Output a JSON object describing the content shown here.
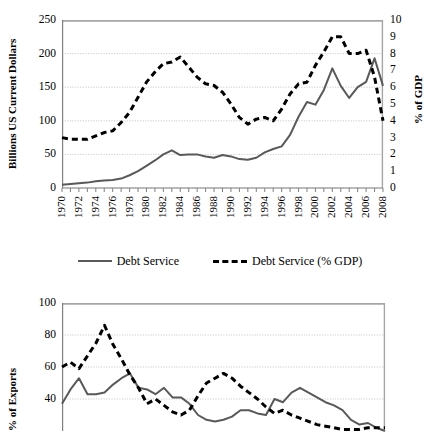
{
  "figure": {
    "background": "#ffffff",
    "series_colors": {
      "solid": "#595959",
      "dashed": "#000000",
      "gridline": "#bfbfbf",
      "border": "#a6a6a6"
    }
  },
  "chart_data": [
    {
      "id": "debt-service-chart",
      "type": "line",
      "title": "",
      "xlabel": "",
      "ylabel": "Billions US Current Dollars",
      "y2label": "% of GDP",
      "xlim": [
        1970,
        2008
      ],
      "ylim": [
        0,
        250
      ],
      "y2lim": [
        0,
        10
      ],
      "yticks": [
        0,
        50,
        100,
        150,
        200,
        250
      ],
      "y2ticks": [
        0,
        1,
        2,
        3,
        4,
        5,
        6,
        7,
        8,
        9,
        10
      ],
      "ytick_labels": [
        "0",
        "50",
        "100",
        "150",
        "200",
        "250"
      ],
      "y2tick_labels": [
        "0",
        "1",
        "2",
        "3",
        "4",
        "5",
        "6",
        "7",
        "8",
        "9",
        "10"
      ],
      "grid": true,
      "legend_position": "bottom",
      "x": [
        1970,
        1971,
        1972,
        1973,
        1974,
        1975,
        1976,
        1977,
        1978,
        1979,
        1980,
        1981,
        1982,
        1983,
        1984,
        1985,
        1986,
        1987,
        1988,
        1989,
        1990,
        1991,
        1992,
        1993,
        1994,
        1995,
        1996,
        1997,
        1998,
        1999,
        2000,
        2001,
        2002,
        2003,
        2004,
        2005,
        2006,
        2007,
        2008
      ],
      "xtick_labels": [
        "1970",
        "1972",
        "1974",
        "1976",
        "1978",
        "1980",
        "1982",
        "1984",
        "1986",
        "1988",
        "1990",
        "1992",
        "1994",
        "1996",
        "1998",
        "2000",
        "2002",
        "2004",
        "2006",
        "2008"
      ],
      "series": [
        {
          "name": "Debt Service",
          "style": "solid",
          "axis": "left",
          "color": "#595959",
          "values": [
            5,
            6,
            7,
            8,
            10,
            11,
            12,
            14,
            19,
            25,
            33,
            41,
            50,
            56,
            49,
            50,
            50,
            47,
            45,
            49,
            47,
            43,
            42,
            45,
            53,
            58,
            62,
            79,
            106,
            128,
            124,
            146,
            178,
            152,
            134,
            150,
            158,
            193,
            152
          ]
        },
        {
          "name": "Debt Service (% GDP)",
          "style": "dashed",
          "axis": "right",
          "color": "#000000",
          "values": [
            3.0,
            2.9,
            2.9,
            2.9,
            3.1,
            3.3,
            3.4,
            3.9,
            4.5,
            5.4,
            6.3,
            6.9,
            7.4,
            7.5,
            7.8,
            7.2,
            6.6,
            6.2,
            6.1,
            5.7,
            5.0,
            4.2,
            3.8,
            4.1,
            4.2,
            4.0,
            4.7,
            5.6,
            6.2,
            6.3,
            7.3,
            8.1,
            9.0,
            9.0,
            8.0,
            8.0,
            8.2,
            6.6,
            4.0
          ]
        }
      ]
    },
    {
      "id": "exports-chart",
      "type": "line",
      "title": "",
      "xlabel": "",
      "ylabel": "% of Exports",
      "xlim": [
        1970,
        2008
      ],
      "ylim": [
        20,
        100
      ],
      "yticks": [
        40,
        60,
        80,
        100
      ],
      "ytick_labels": [
        "40",
        "60",
        "80",
        "100"
      ],
      "grid": true,
      "legend_position": "none",
      "note": "lower chart is cropped by the bottom edge of the screenshot",
      "x": [
        1970,
        1971,
        1972,
        1973,
        1974,
        1975,
        1976,
        1977,
        1978,
        1979,
        1980,
        1981,
        1982,
        1983,
        1984,
        1985,
        1986,
        1987,
        1988,
        1989,
        1990,
        1991,
        1992,
        1993,
        1994,
        1995,
        1996,
        1997,
        1998,
        1999,
        2000,
        2001,
        2002,
        2003,
        2004,
        2005,
        2006,
        2007,
        2008
      ],
      "series": [
        {
          "name": "Debt Service",
          "style": "solid",
          "axis": "left",
          "color": "#595959",
          "values": [
            37,
            46,
            53,
            43,
            43,
            44,
            49,
            53,
            56,
            47,
            46,
            43,
            47,
            41,
            41,
            37,
            30,
            27,
            26,
            27,
            29,
            33,
            33,
            31,
            30,
            40,
            38,
            44,
            47,
            44,
            41,
            38,
            36,
            33,
            27,
            24,
            25,
            22,
            20
          ]
        },
        {
          "name": "Debt Service (% GDP)",
          "style": "dashed",
          "axis": "left",
          "color": "#000000",
          "values": [
            60,
            63,
            59,
            67,
            75,
            86,
            74,
            65,
            55,
            47,
            37,
            40,
            36,
            32,
            30,
            33,
            42,
            50,
            53,
            56,
            53,
            48,
            44,
            40,
            35,
            31,
            33,
            30,
            28,
            26,
            24,
            23,
            22,
            21,
            21,
            21,
            22,
            22,
            22
          ]
        }
      ]
    }
  ],
  "charts": {
    "chart1": {
      "ylabel": "Billions US Current Dollars",
      "y2label": "% of GDP"
    },
    "chart2": {
      "ylabel": "% of Exports"
    }
  },
  "legend": {
    "entries": [
      {
        "label": "Debt Service",
        "style": "solid"
      },
      {
        "label": "Debt Service (% GDP)",
        "style": "dashed"
      }
    ]
  }
}
